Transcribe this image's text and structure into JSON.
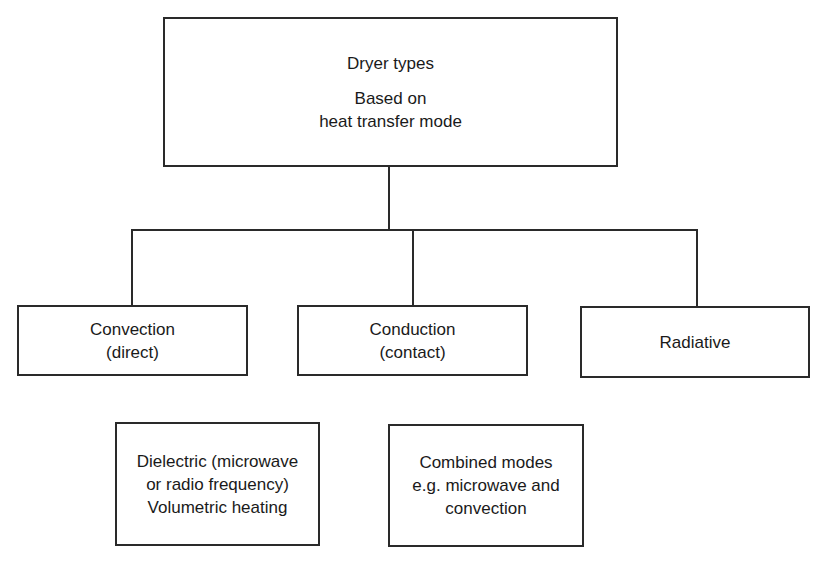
{
  "diagram": {
    "root": {
      "line1": "Dryer types",
      "line2": "Based on",
      "line3": "heat transfer mode"
    },
    "children": [
      {
        "line1": "Convection",
        "line2": "(direct)"
      },
      {
        "line1": "Conduction",
        "line2": "(contact)"
      },
      {
        "line1": "Radiative"
      }
    ],
    "additional": [
      {
        "line1": "Dielectric (microwave",
        "line2": "or radio frequency)",
        "line3": "Volumetric heating"
      },
      {
        "line1": "Combined modes",
        "line2": "e.g. microwave and",
        "line3": "convection"
      }
    ],
    "colors": {
      "line": "#2a2a2a",
      "text": "#1a1a1a",
      "background": "#ffffff"
    }
  }
}
